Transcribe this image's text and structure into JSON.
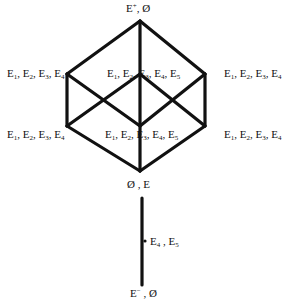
{
  "diagram": {
    "type": "lattice",
    "stroke_color": "#111111",
    "cube": {
      "vertices": {
        "top": {
          "x": 140,
          "y": 21
        },
        "left_upper": {
          "x": 67,
          "y": 74
        },
        "center_upper": {
          "x": 140,
          "y": 74
        },
        "right_upper": {
          "x": 205,
          "y": 74
        },
        "left_lower": {
          "x": 67,
          "y": 126
        },
        "center_lower": {
          "x": 140,
          "y": 126
        },
        "right_lower": {
          "x": 205,
          "y": 126
        },
        "bottom": {
          "x": 140,
          "y": 171
        }
      }
    },
    "chain": {
      "x": 142,
      "y_top": 198,
      "y_bottom": 285,
      "dot": {
        "x": 145,
        "y": 241
      }
    },
    "labels": {
      "top": {
        "base": "E",
        "sup": "+",
        "rest": ", Ø"
      },
      "left_upper": {
        "parts": [
          "E",
          "1",
          ", E",
          "2",
          ", E",
          "3",
          ", E",
          "4"
        ]
      },
      "center_upper": {
        "parts": [
          "E",
          "1",
          ", E",
          "2",
          ", E",
          "3",
          ", E",
          "4",
          ", E",
          "5"
        ]
      },
      "right_upper": {
        "parts": [
          "E",
          "1",
          ", E",
          "2",
          ", E",
          "3",
          ", E",
          "4"
        ]
      },
      "left_lower": {
        "parts": [
          "E",
          "1",
          ", E",
          "2",
          ", E",
          "3",
          ", E",
          "4"
        ]
      },
      "center_lower": {
        "parts": [
          "E",
          "1",
          ", E",
          "2",
          ", E",
          "3",
          ", E",
          "4",
          ", E",
          "5"
        ]
      },
      "right_lower": {
        "parts": [
          "E",
          "1",
          ", E",
          "2",
          ", E",
          "3",
          ", E",
          "4"
        ]
      },
      "bottom_cube": {
        "text": "Ø , E"
      },
      "chain_mid": {
        "parts": [
          "E",
          "4",
          " , E",
          "5"
        ]
      },
      "chain_bottom": {
        "base": "E",
        "sup": "−",
        "rest": " , Ø"
      }
    }
  }
}
